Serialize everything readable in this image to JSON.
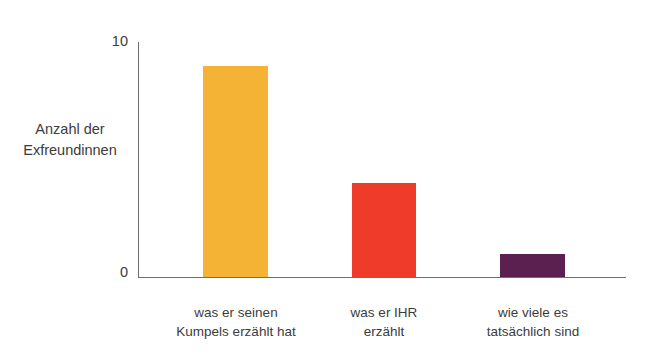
{
  "chart_data": {
    "type": "bar",
    "title": "",
    "subtitle": "",
    "xlabel": "",
    "ylabel": "Anzahl der\nExfreundinnen",
    "ylim": [
      0,
      10
    ],
    "ytick_labels": [
      "0",
      "10"
    ],
    "ytick_values": [
      0,
      10
    ],
    "grid": false,
    "legend": null,
    "categories": [
      "was er seinen\nKumpels erzählt hat",
      "was er IHR\nerzählt",
      "wie viele es\ntatsächlich sind"
    ],
    "values": [
      9,
      4,
      1
    ],
    "bar_colors": [
      "#F5B335",
      "#EE3B2A",
      "#5C2050"
    ],
    "axis_color": "#6e6e6e",
    "text_color": "#3c3c3c",
    "background_color": "#ffffff"
  },
  "axis": {
    "y_title": "Anzahl der\nExfreundinnen",
    "y_tick_top": "10",
    "y_tick_bottom": "0"
  },
  "categories": {
    "c0": "was er seinen\nKumpels erzählt hat",
    "c1": "was er IHR\nerzählt",
    "c2": "wie viele es\ntatsächlich sind"
  }
}
